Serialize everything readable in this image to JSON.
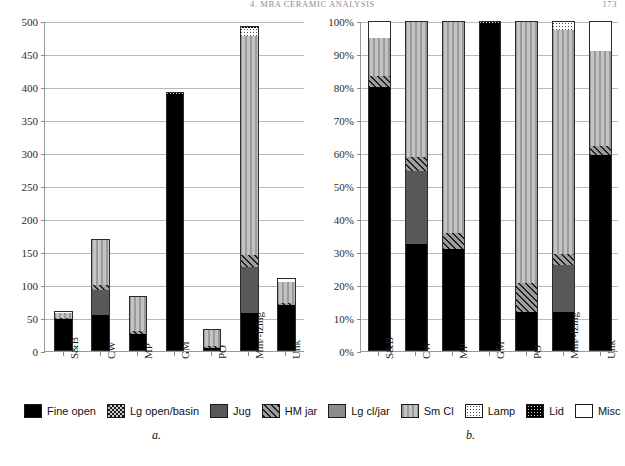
{
  "header": {
    "running_title": "4. MBA CERAMIC ANALYSIS",
    "page_number": "173"
  },
  "captions": {
    "left": "a.",
    "right": "b."
  },
  "legend": {
    "items": [
      {
        "label": "Fine open",
        "key": "fine-open",
        "fill": "#000000"
      },
      {
        "label": "Lg open/basin",
        "key": "lg-open-basin",
        "fill": "#1a1a1a"
      },
      {
        "label": "Jug",
        "key": "jug",
        "fill": "#585858"
      },
      {
        "label": "HM jar",
        "key": "hm-jar",
        "fill": "#9d9d9d"
      },
      {
        "label": "Lg cl/jar",
        "key": "lg-cl-jar",
        "fill": "#8c8c8c"
      },
      {
        "label": "Sm Cl",
        "key": "sm-cl",
        "fill": "#b6b6b6"
      },
      {
        "label": "Lamp",
        "key": "lamp",
        "fill": "#ffffff"
      },
      {
        "label": "Lid",
        "key": "lid",
        "fill": "#000000"
      },
      {
        "label": "Misc",
        "key": "misc",
        "fill": "#ffffff"
      }
    ]
  },
  "chart_data": [
    {
      "id": "a",
      "type": "bar",
      "stacked": true,
      "title": "",
      "xlabel": "",
      "ylabel": "",
      "ylim": [
        0,
        500
      ],
      "yticks": [
        0,
        50,
        100,
        150,
        200,
        250,
        300,
        350,
        400,
        450,
        500
      ],
      "ytick_labels": [
        "0",
        "50",
        "100",
        "150",
        "200",
        "250",
        "300",
        "350",
        "400",
        "450",
        "500"
      ],
      "grid": true,
      "legend_position": "bottom",
      "categories": [
        "S&B",
        "CW",
        "MP",
        "GM",
        "PO",
        "Min/-izing",
        "Unk"
      ],
      "series": [
        {
          "name": "Fine open",
          "values": [
            48,
            55,
            26,
            390,
            4,
            58,
            70
          ]
        },
        {
          "name": "Lg open/basin",
          "values": [
            0,
            0,
            0,
            0,
            0,
            0,
            0
          ]
        },
        {
          "name": "Jug",
          "values": [
            0,
            38,
            0,
            0,
            0,
            70,
            0
          ]
        },
        {
          "name": "HM jar",
          "values": [
            2,
            7,
            4,
            0,
            3,
            17,
            3
          ]
        },
        {
          "name": "Lg cl/jar",
          "values": [
            0,
            0,
            0,
            0,
            0,
            0,
            0
          ]
        },
        {
          "name": "Sm Cl",
          "values": [
            7,
            70,
            54,
            0,
            27,
            333,
            32
          ]
        },
        {
          "name": "Lamp",
          "values": [
            0,
            0,
            0,
            0,
            0,
            12,
            0
          ]
        },
        {
          "name": "Lid",
          "values": [
            0,
            0,
            0,
            2,
            0,
            2,
            0
          ]
        },
        {
          "name": "Misc",
          "values": [
            3,
            0,
            0,
            0,
            0,
            0,
            6
          ]
        }
      ],
      "totals": [
        60,
        170,
        84,
        392,
        34,
        492,
        111
      ]
    },
    {
      "id": "b",
      "type": "bar",
      "stacked": true,
      "normalized": true,
      "title": "",
      "xlabel": "",
      "ylabel": "",
      "ylim": [
        0,
        100
      ],
      "yticks": [
        0,
        10,
        20,
        30,
        40,
        50,
        60,
        70,
        80,
        90,
        100
      ],
      "ytick_labels": [
        "0%",
        "10%",
        "20%",
        "30%",
        "40%",
        "50%",
        "60%",
        "70%",
        "80%",
        "90%",
        "100%"
      ],
      "grid": true,
      "legend_position": "bottom",
      "categories": [
        "S&B",
        "CW",
        "MP",
        "GM",
        "PO",
        "Min/-izing",
        "Unk"
      ],
      "series": [
        {
          "name": "Fine open",
          "values": [
            80.0,
            32.4,
            31.0,
            99.5,
            11.8,
            11.8,
            59.5
          ]
        },
        {
          "name": "Lg open/basin",
          "values": [
            0,
            0,
            0,
            0,
            0,
            0,
            0
          ]
        },
        {
          "name": "Jug",
          "values": [
            0,
            22.3,
            0,
            0,
            0,
            14.2,
            0
          ]
        },
        {
          "name": "HM jar",
          "values": [
            3.3,
            4.1,
            4.8,
            0,
            8.8,
            3.5,
            2.7
          ]
        },
        {
          "name": "Lg cl/jar",
          "values": [
            0,
            0,
            0,
            0,
            0,
            0,
            0
          ]
        },
        {
          "name": "Sm Cl",
          "values": [
            11.7,
            41.2,
            64.2,
            0,
            79.4,
            67.7,
            28.8
          ]
        },
        {
          "name": "Lamp",
          "values": [
            0,
            0,
            0,
            0,
            0,
            2.4,
            0
          ]
        },
        {
          "name": "Lid",
          "values": [
            0,
            0,
            0,
            0.5,
            0,
            0.4,
            0
          ]
        },
        {
          "name": "Misc",
          "values": [
            5.0,
            0,
            0,
            0,
            0,
            0,
            9.0
          ]
        }
      ],
      "totals": [
        100,
        100,
        100,
        100,
        100,
        100,
        100
      ]
    }
  ]
}
